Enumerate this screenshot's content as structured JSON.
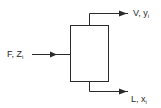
{
  "diagram": {
    "type": "flash-drum",
    "feed": {
      "label": "F, Z",
      "subscript": "i"
    },
    "vapor_outlet": {
      "label": "V, y",
      "subscript": "i"
    },
    "liquid_outlet": {
      "label": "L, x",
      "subscript": "i"
    },
    "colors": {
      "stroke": "#2a2a2a",
      "background": "#ffffff"
    }
  }
}
